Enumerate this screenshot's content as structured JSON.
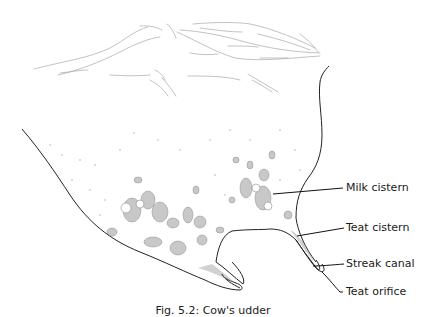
{
  "figure": {
    "labels": [
      {
        "id": "milk-cistern",
        "text": "Milk cistern"
      },
      {
        "id": "teat-cistern",
        "text": "Teat cistern"
      },
      {
        "id": "streak-canal",
        "text": "Streak canal"
      },
      {
        "id": "teat-orifice",
        "text": "Teat orifice"
      }
    ],
    "caption": "Fig. 5.2: Cow's udder"
  },
  "colors": {
    "line": "#222222",
    "sketch": "#9a9a9a",
    "tissue": "#8c8c8c",
    "background": "#ffffff"
  }
}
